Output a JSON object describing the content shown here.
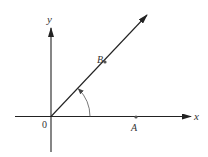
{
  "diagram": {
    "type": "coordinate-angle-diagram",
    "colors": {
      "background": "#ffffff",
      "stroke": "#222222",
      "label": "#333333",
      "point": "#555555"
    },
    "axes": {
      "x_label": "x",
      "y_label": "y",
      "origin_label": "0"
    },
    "points": [
      {
        "id": "A",
        "label": "A",
        "on": "x-axis"
      },
      {
        "id": "B",
        "label": "B",
        "on": "terminal-ray"
      }
    ],
    "ray": {
      "from": "origin",
      "through": "B",
      "arrow": true
    },
    "angle_arc": {
      "from": "x-axis",
      "to": "ray",
      "direction": "counterclockwise",
      "arrow": true
    }
  }
}
